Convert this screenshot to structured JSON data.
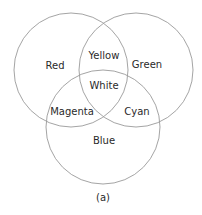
{
  "diagram": {
    "type": "venn",
    "caption": "(a)",
    "circles": [
      {
        "name": "Red",
        "cx": 71,
        "cy": 70,
        "r": 57
      },
      {
        "name": "Green",
        "cx": 136,
        "cy": 70,
        "r": 57
      },
      {
        "name": "Blue",
        "cx": 103,
        "cy": 127,
        "r": 57
      }
    ],
    "regions": {
      "red": "Red",
      "green": "Green",
      "blue": "Blue",
      "red_green": "Yellow",
      "red_blue": "Magenta",
      "green_blue": "Cyan",
      "center": "White"
    },
    "colors": {
      "stroke": "#9a9a9a",
      "text": "#2a2a2a",
      "background": "#ffffff"
    }
  }
}
